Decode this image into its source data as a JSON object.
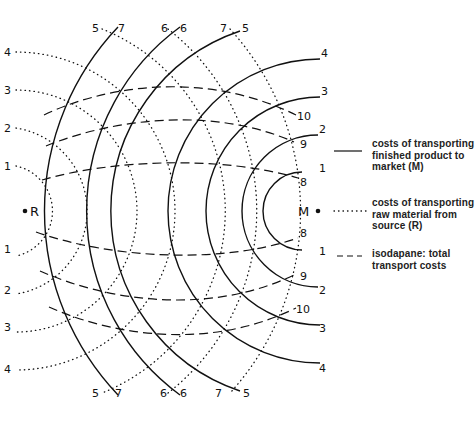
{
  "points": {
    "market": {
      "label": "M",
      "x": 318,
      "y": 211
    },
    "source": {
      "label": "R",
      "x": 25,
      "y": 211
    }
  },
  "product_cost_circles": {
    "style": "solid",
    "center": "M",
    "labels": [
      "1",
      "2",
      "3",
      "4",
      "5",
      "6",
      "7"
    ],
    "radii": [
      36,
      76,
      114,
      152,
      190,
      228,
      267
    ]
  },
  "raw_material_cost_circles": {
    "style": "dotted",
    "center": "R",
    "labels": [
      "1",
      "2",
      "3",
      "4",
      "5",
      "6",
      "7"
    ],
    "radii": [
      37,
      75,
      113,
      151,
      190,
      228,
      267
    ]
  },
  "isodapanes": {
    "style": "dashed",
    "labels": [
      "8",
      "9",
      "10"
    ]
  },
  "top_labels": {
    "pair1": {
      "dotted": "5",
      "solid": "7"
    },
    "pair2": {
      "dotted": "6",
      "solid": "6"
    },
    "pair3": {
      "dotted": "7",
      "solid": "5"
    }
  },
  "bottom_labels": {
    "pair1": {
      "dotted": "5",
      "solid": "7"
    },
    "pair2": {
      "dotted": "6",
      "solid": "6"
    },
    "pair3": {
      "dotted": "7",
      "solid": "5"
    }
  },
  "left_labels": {
    "top": [
      "4",
      "3",
      "2",
      "1"
    ],
    "bottom": [
      "1",
      "2",
      "3",
      "4"
    ]
  },
  "right_labels": {
    "solid_top": [
      "4",
      "3",
      "2",
      "1"
    ],
    "solid_bottom": [
      "1",
      "2",
      "3",
      "4"
    ],
    "dashed_top": [
      "10",
      "9",
      "8"
    ],
    "dashed_bottom": [
      "8",
      "9",
      "10"
    ]
  },
  "legend": {
    "items": [
      {
        "style": "solid",
        "text": "costs of transporting\nfinished product to\nmarket (M)"
      },
      {
        "style": "dotted",
        "text": "costs of transporting\nraw material from\nsource (R)"
      },
      {
        "style": "dashed",
        "text": "isodapane: total\ntransport costs"
      }
    ]
  },
  "colors": {
    "ink": "#111111",
    "background": "#ffffff"
  }
}
